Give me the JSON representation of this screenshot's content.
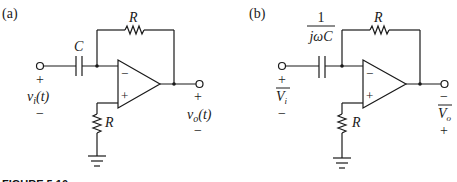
{
  "figure": {
    "caption": "FIGURE 5.10",
    "panels": [
      {
        "label": "(a)",
        "feedback_resistor": "R",
        "input_element": "C",
        "ground_resistor": "R",
        "input_voltage": "v",
        "input_voltage_sub": "i",
        "input_voltage_arg": "(t)",
        "output_voltage": "v",
        "output_voltage_sub": "o",
        "output_voltage_arg": "(t)",
        "input_plus": "+",
        "input_minus": "−",
        "output_plus": "+",
        "output_minus": "−",
        "opamp_inverting": "−",
        "opamp_noninverting": "+"
      },
      {
        "label": "(b)",
        "feedback_resistor": "R",
        "input_element_num": "1",
        "input_element_den": "jωC",
        "ground_resistor": "R",
        "input_voltage": "V",
        "input_voltage_sub": "i",
        "output_voltage": "V",
        "output_voltage_sub": "o",
        "input_plus": "+",
        "input_minus": "−",
        "output_top": "−",
        "output_bottom": "+",
        "opamp_inverting": "−",
        "opamp_noninverting": "+"
      }
    ]
  }
}
